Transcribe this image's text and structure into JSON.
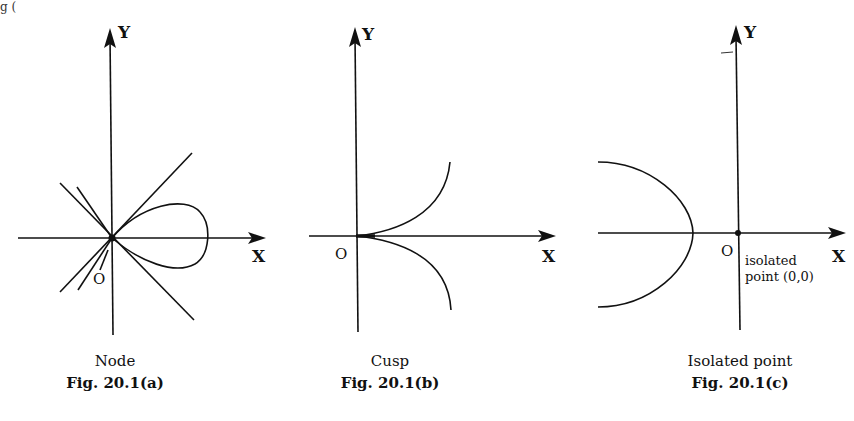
{
  "panels": [
    {
      "id": "a",
      "name": "Node",
      "figure_number": "Fig. 20.1(a)",
      "axis_x_label": "X",
      "axis_y_label": "Y",
      "origin_label": "O",
      "description": "Loop curve crossing itself at the origin with two tangent lines through O"
    },
    {
      "id": "b",
      "name": "Cusp",
      "figure_number": "Fig. 20.1(b)",
      "axis_x_label": "X",
      "axis_y_label": "Y",
      "origin_label": "O",
      "description": "Two branches meeting at the origin with a common tangent along the x-axis"
    },
    {
      "id": "c",
      "name": "Isolated point",
      "figure_number": "Fig. 20.1(c)",
      "axis_x_label": "X",
      "axis_y_label": "Y",
      "origin_label": "O",
      "annotation_line1": "isolated",
      "annotation_line2": "point (0,0)",
      "description": "Curve branch to the left of the origin; origin is an isolated point"
    }
  ],
  "stray_text": "g ("
}
